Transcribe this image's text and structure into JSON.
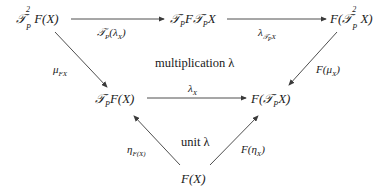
{
  "diagram": {
    "nodes": {
      "top_left": "𝒯²ₚF(X)",
      "top_middle": "𝒯ₚF𝒯ₚX",
      "top_right": "F(𝒯²ₚX)",
      "mid_left": "𝒯ₚF(X)",
      "mid_right": "F(𝒯ₚX)",
      "bottom": "F(X)"
    },
    "arrows": {
      "top_left_to_top_middle": "𝒯ₚ(λ_X)",
      "top_middle_to_top_right": "λ_{𝒯ₚX}",
      "top_left_to_mid_left": "μ_{FX}",
      "top_right_to_mid_right": "F(μ_X)",
      "mid_left_to_mid_right": "λ_X",
      "bottom_to_mid_left": "η_{F(X)}",
      "bottom_to_mid_right": "F(η_X)"
    },
    "regions": {
      "upper": "multiplication λ",
      "lower": "unit λ"
    },
    "line_color": "#3a3a3a"
  }
}
